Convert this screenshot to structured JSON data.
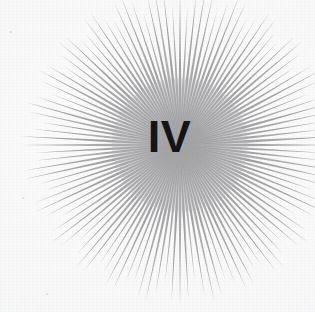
{
  "artwork": {
    "kind": "radial-sunburst-chapter-divider",
    "numeral": "IV",
    "numeral_color": "#141414",
    "background_color": "#f7f7f8",
    "ray_color": "#9a9a9c",
    "glow_color": "#a2a2a5",
    "ray_count": 116,
    "center_x": 180,
    "center_y": 145,
    "inner_radius": 4,
    "outer_radius": 152,
    "ray_half_width_deg": 1.08,
    "glow_radius": 68,
    "canvas_width": 315,
    "canvas_height": 312
  }
}
